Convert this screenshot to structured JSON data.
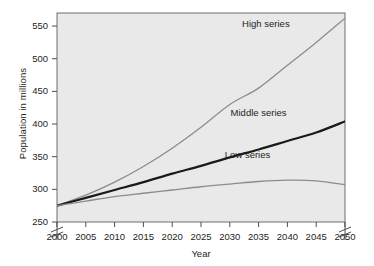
{
  "chart_data": {
    "type": "line",
    "title": "",
    "xlabel": "Year",
    "ylabel": "Population in millions",
    "xlim": [
      2000,
      2050
    ],
    "ylim": [
      250,
      570
    ],
    "grid": false,
    "legend_position": "inline-labels",
    "axis_breaks": {
      "y_break_below": 250,
      "x_break_near": 2050
    },
    "xticks": [
      "2000",
      "2005",
      "2010",
      "2015",
      "2020",
      "2025",
      "2030",
      "2035",
      "2040",
      "2045",
      "2050"
    ],
    "xtick_values": [
      2000,
      2005,
      2010,
      2015,
      2020,
      2025,
      2030,
      2035,
      2040,
      2045,
      2050
    ],
    "yticks": [
      "250",
      "300",
      "350",
      "400",
      "450",
      "500",
      "550"
    ],
    "ytick_values": [
      250,
      300,
      350,
      400,
      450,
      500,
      550
    ],
    "x": [
      2000,
      2005,
      2010,
      2015,
      2020,
      2025,
      2030,
      2035,
      2040,
      2045,
      2050
    ],
    "series": [
      {
        "name": "High series",
        "color": "#8c8c8c",
        "width": 1.3,
        "label_x": 2037,
        "label_y": 553,
        "values": [
          275,
          291,
          311,
          335,
          363,
          395,
          430,
          455,
          490,
          525,
          562
        ]
      },
      {
        "name": "Middle series",
        "color": "#1a1a1a",
        "width": 2.2,
        "label_x": 2035,
        "label_y": 417,
        "values": [
          275,
          287,
          299,
          311,
          324,
          336,
          349,
          361,
          374,
          387,
          404
        ]
      },
      {
        "name": "Low series",
        "color": "#8c8c8c",
        "width": 1.3,
        "label_x": 2034,
        "label_y": 352,
        "values": [
          275,
          282,
          289,
          294,
          299,
          304,
          308,
          312,
          314,
          313,
          307
        ]
      }
    ]
  },
  "axis": {
    "xlabel": "Year",
    "ylabel": "Population in millions"
  }
}
